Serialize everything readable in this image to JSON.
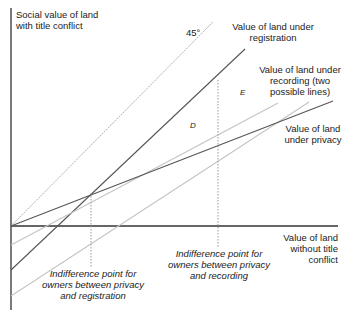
{
  "diagram": {
    "axes": {
      "y_label": [
        "Social value of land",
        "with title conflict"
      ],
      "x_label": [
        "Value of land",
        "without title",
        "conflict"
      ]
    },
    "lines": {
      "fortyfive": {
        "label": "45°",
        "color": "#b8b8b8",
        "style": "dotted"
      },
      "registration": {
        "label": [
          "Value of land under",
          "registration"
        ],
        "color": "#555555"
      },
      "recording": {
        "label": [
          "Value of land under",
          "recording (two",
          "possible lines)"
        ],
        "color": "#c0c0c0"
      },
      "privacy": {
        "label": [
          "Value of land",
          "under privacy"
        ],
        "color": "#555555"
      }
    },
    "regions": {
      "d": "D",
      "e": "E"
    },
    "annotations": {
      "privacy_registration": [
        "Indifference point for",
        "owners between privacy",
        "and registration"
      ],
      "privacy_recording": [
        "Indifference point for",
        "owners between privacy",
        "and recording"
      ]
    }
  }
}
